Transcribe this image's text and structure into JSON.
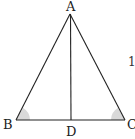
{
  "diagram": {
    "type": "geometry-triangle",
    "colors": {
      "stroke": "#222222",
      "angle_fill": "#d9d9d9",
      "background": "#ffffff"
    },
    "points": {
      "A": {
        "label": "A",
        "x": 70,
        "y": 14
      },
      "B": {
        "label": "B",
        "x": 16,
        "y": 120
      },
      "C": {
        "label": "C",
        "x": 125,
        "y": 120
      },
      "D": {
        "label": "D",
        "x": 71,
        "y": 120
      }
    },
    "segments": [
      "AB",
      "AC",
      "BC",
      "AD"
    ],
    "marked_angles": [
      "B",
      "C"
    ],
    "partial_text": "1"
  }
}
